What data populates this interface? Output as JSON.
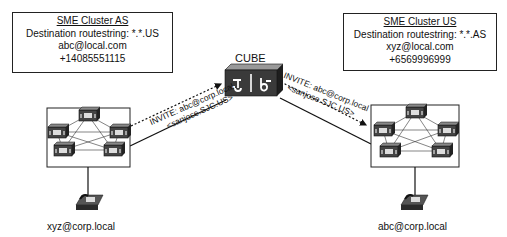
{
  "left_cluster": {
    "title": "SME Cluster AS",
    "routestring": "Destination routestring: *.*.US",
    "uri": "abc@local.com",
    "number": "+14085551115"
  },
  "right_cluster": {
    "title": "SME Cluster US",
    "routestring": "Destination routestring: *.*.AS",
    "uri": "xyz@local.com",
    "number": "+6569996999"
  },
  "cube": {
    "label": "CUBE",
    "icon": "router-icon"
  },
  "messages": {
    "left": {
      "line1": "INVITE: abc@corp.local",
      "line2": "<sanjose.SJC.US>"
    },
    "right": {
      "line1": "INVITE: abc@corp.local",
      "line2": "<sanjose.SJC.US>"
    }
  },
  "phones": {
    "left": {
      "label": "xyz@corp.local",
      "badge": "IP"
    },
    "right": {
      "label": "abc@corp.local",
      "badge": "IP"
    }
  },
  "colors": {
    "line": "#222222",
    "device": "#3a3a3a",
    "background": "#ffffff"
  }
}
